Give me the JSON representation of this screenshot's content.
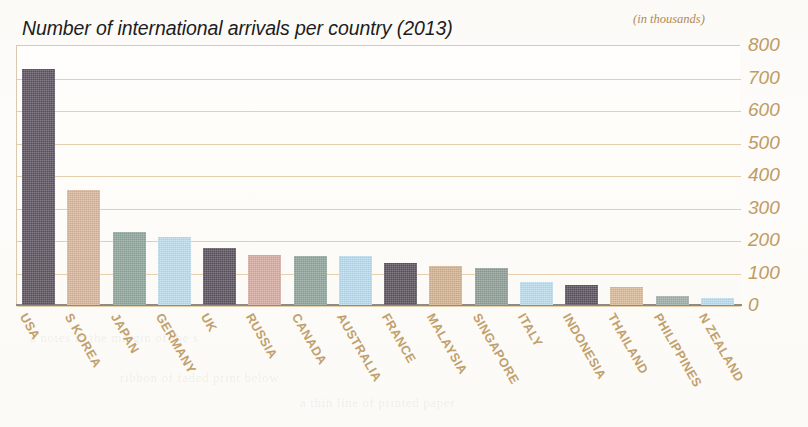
{
  "chart_data": {
    "type": "bar",
    "title": "Number of international arrivals per country (2013)",
    "units_note": "(in thousands)",
    "xlabel": "",
    "ylabel": "",
    "ylim": [
      0,
      800
    ],
    "ytick_step": 100,
    "grid": true,
    "legend": "none",
    "yticks": [
      "800",
      "700",
      "600",
      "500",
      "400",
      "300",
      "200",
      "100",
      "0"
    ],
    "categories": [
      "USA",
      "S KOREA",
      "JAPAN",
      "GERMANY",
      "UK",
      "RUSSIA",
      "CANADA",
      "AUSTRALIA",
      "FRANCE",
      "MALAYSIA",
      "SINGAPORE",
      "ITALY",
      "INDONESIA",
      "THAILAND",
      "PHILIPPINES",
      "N ZEALAND"
    ],
    "values": [
      725,
      355,
      225,
      210,
      175,
      155,
      150,
      150,
      130,
      120,
      115,
      70,
      62,
      55,
      28,
      22
    ],
    "bar_colors": [
      "#5d5360",
      "#d9b79b",
      "#91a79c",
      "#bcdcef",
      "#5d5360",
      "#d9ab9f",
      "#8ea69c",
      "#b9dbef",
      "#5d5360",
      "#d4b391",
      "#8f9f98",
      "#bcdcef",
      "#5d5360",
      "#d9bb97",
      "#9fb0a8",
      "#bcdcef"
    ],
    "palette": {
      "background": "#fbfaf7",
      "gridline": "#e3cfac",
      "axis": "#8e8b84",
      "tick_text": "#c09b64",
      "category_text": "#c2a06c",
      "title_text": "#1d1d1d",
      "units_text": "#b08a55"
    }
  },
  "bleed_text": [
    "a notes in the margin of the s",
    "ribbon of faded print below",
    "a thin line of printed paper"
  ]
}
